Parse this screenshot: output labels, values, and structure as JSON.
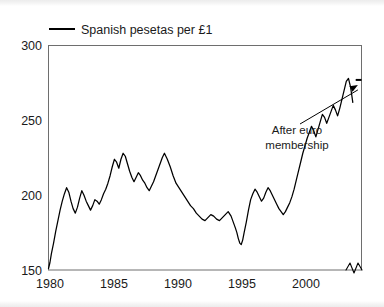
{
  "chart_data": {
    "type": "line",
    "title": "",
    "xlabel": "",
    "ylabel": "",
    "xlim": [
      1980,
      2001.6
    ],
    "ylim": [
      150,
      300
    ],
    "grid": false,
    "legend_position": "top-left",
    "legend": [
      "Spanish pesetas per £1"
    ],
    "yticks": [
      150,
      200,
      250,
      300
    ],
    "xticks": [
      1980,
      1985,
      1990,
      1995,
      2000
    ],
    "axis_break": {
      "axis": "x",
      "at_year": 2001.15,
      "label": ""
    },
    "annotations": [
      {
        "text_line1": "After euro",
        "text_line2": "membership",
        "points_to_year": 2001.35,
        "points_to_value": 277
      }
    ],
    "series": [
      {
        "name": "Spanish pesetas per £1",
        "color": "#000000",
        "post_euro_fixed_rate": 277,
        "post_euro_span_years": [
          2001.2,
          2001.6
        ],
        "x": [
          1980.0,
          1980.1,
          1980.2,
          1980.35,
          1980.5,
          1980.65,
          1980.8,
          1980.95,
          1981.1,
          1981.25,
          1981.4,
          1981.55,
          1981.7,
          1981.85,
          1982.0,
          1982.15,
          1982.3,
          1982.45,
          1982.6,
          1982.75,
          1982.9,
          1983.05,
          1983.2,
          1983.35,
          1983.5,
          1983.65,
          1983.8,
          1983.95,
          1984.1,
          1984.25,
          1984.4,
          1984.55,
          1984.7,
          1984.85,
          1985.0,
          1985.15,
          1985.3,
          1985.45,
          1985.6,
          1985.75,
          1985.9,
          1986.05,
          1986.2,
          1986.35,
          1986.5,
          1986.65,
          1986.8,
          1986.95,
          1987.1,
          1987.25,
          1987.4,
          1987.55,
          1987.7,
          1987.85,
          1988.0,
          1988.2,
          1988.4,
          1988.6,
          1988.8,
          1989.0,
          1989.2,
          1989.4,
          1989.6,
          1989.8,
          1990.0,
          1990.2,
          1990.4,
          1990.6,
          1990.8,
          1991.0,
          1991.2,
          1991.4,
          1991.6,
          1991.8,
          1992.0,
          1992.2,
          1992.4,
          1992.6,
          1992.75,
          1992.9,
          1993.0,
          1993.1,
          1993.2,
          1993.3,
          1993.4,
          1993.5,
          1993.65,
          1993.8,
          1993.95,
          1994.1,
          1994.25,
          1994.4,
          1994.55,
          1994.7,
          1994.85,
          1995.0,
          1995.15,
          1995.3,
          1995.45,
          1995.6,
          1995.75,
          1995.9,
          1996.05,
          1996.2,
          1996.35,
          1996.5,
          1996.65,
          1996.8,
          1996.95,
          1997.1,
          1997.25,
          1997.4,
          1997.55,
          1997.7,
          1997.85,
          1998.0,
          1998.15,
          1998.3,
          1998.45,
          1998.6,
          1998.75,
          1998.9,
          1999.05,
          1999.2,
          1999.35,
          1999.5,
          1999.65,
          1999.8,
          1999.95,
          2000.1,
          2000.25,
          2000.4,
          2000.55,
          2000.7,
          2000.85,
          2001.0
        ],
        "y": [
          151,
          155,
          161,
          168,
          176,
          183,
          190,
          196,
          201,
          205,
          202,
          196,
          191,
          188,
          192,
          198,
          203,
          200,
          196,
          193,
          190,
          193,
          197,
          196,
          194,
          197,
          201,
          204,
          208,
          213,
          219,
          224,
          222,
          218,
          224,
          228,
          226,
          221,
          216,
          212,
          209,
          212,
          215,
          213,
          210,
          208,
          205,
          203,
          206,
          209,
          213,
          217,
          221,
          225,
          228,
          224,
          219,
          213,
          208,
          205,
          202,
          199,
          196,
          193,
          191,
          188,
          186,
          184,
          183,
          185,
          187,
          186,
          184,
          183,
          185,
          187,
          189,
          186,
          182,
          178,
          175,
          171,
          168,
          167,
          170,
          175,
          182,
          190,
          197,
          201,
          204,
          202,
          199,
          196,
          198,
          202,
          205,
          203,
          200,
          197,
          194,
          191,
          189,
          187,
          189,
          192,
          195,
          199,
          204,
          210,
          216,
          222,
          228,
          233,
          238,
          242,
          246,
          243,
          239,
          244,
          249,
          254,
          252,
          248,
          252,
          256,
          260,
          257,
          253,
          258,
          264,
          270,
          276,
          278,
          272,
          262
        ]
      }
    ]
  },
  "legend": {
    "label": "Spanish pesetas per £1"
  },
  "axes": {
    "y_ticks": [
      "300",
      "250",
      "200",
      "150"
    ],
    "x_ticks": [
      "1980",
      "1985",
      "1990",
      "1995",
      "2000"
    ]
  },
  "annotation": {
    "line1": "After euro",
    "line2": "membership"
  }
}
